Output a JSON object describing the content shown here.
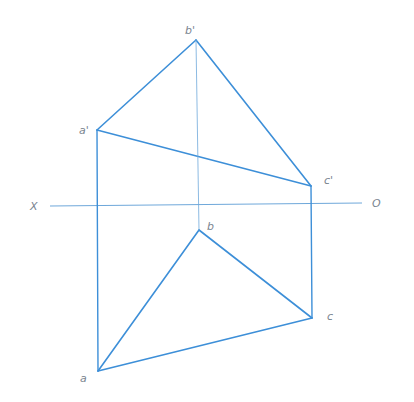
{
  "diagram": {
    "colors": {
      "edge": "#3d8fd8",
      "projection": "#3d8fd8",
      "axis": "#6fa8da",
      "label": "#7a8590",
      "background": "#ffffff"
    },
    "axis": {
      "left_label": "X",
      "right_label": "O",
      "x1": 50,
      "y1": 206,
      "x2": 362,
      "y2": 203
    },
    "points": {
      "b_prime": {
        "label": "b'",
        "x": 196,
        "y": 40,
        "lx": 185,
        "ly": 34
      },
      "a_prime": {
        "label": "a'",
        "x": 97,
        "y": 130,
        "lx": 79,
        "ly": 134
      },
      "c_prime": {
        "label": "c'",
        "x": 311,
        "y": 186,
        "lx": 324,
        "ly": 184
      },
      "b": {
        "label": "b",
        "x": 199,
        "y": 230,
        "lx": 207,
        "ly": 230
      },
      "c": {
        "label": "c",
        "x": 312,
        "y": 318,
        "lx": 327,
        "ly": 320
      },
      "a": {
        "label": "a",
        "x": 98,
        "y": 371,
        "lx": 80,
        "ly": 382
      }
    },
    "edges": [
      {
        "from": "a_prime",
        "to": "b_prime",
        "kind": "edge"
      },
      {
        "from": "b_prime",
        "to": "c_prime",
        "kind": "edge"
      },
      {
        "from": "a_prime",
        "to": "c_prime",
        "kind": "edge"
      },
      {
        "from": "a",
        "to": "b",
        "kind": "edge"
      },
      {
        "from": "b",
        "to": "c",
        "kind": "edge"
      },
      {
        "from": "a",
        "to": "c",
        "kind": "edge"
      },
      {
        "from": "a_prime",
        "to": "a",
        "kind": "projection"
      },
      {
        "from": "c_prime",
        "to": "c",
        "kind": "projection"
      },
      {
        "from": "b_prime",
        "to": "b",
        "kind": "thin"
      }
    ]
  }
}
